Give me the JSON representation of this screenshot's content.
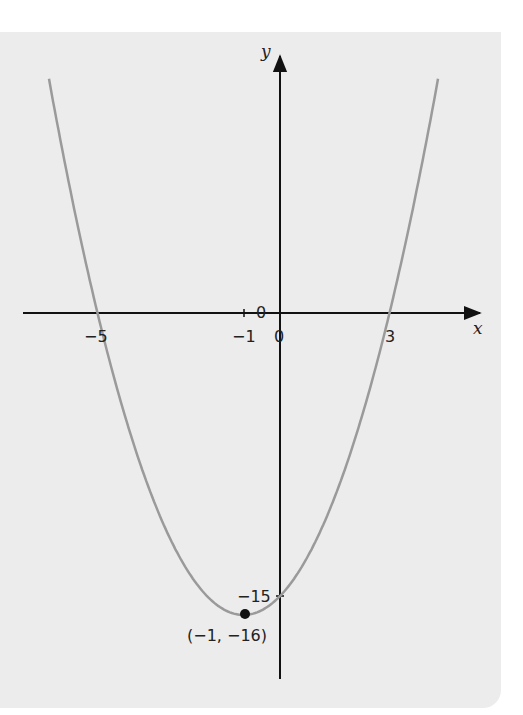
{
  "chart_data": {
    "type": "line",
    "title": "",
    "function": "y = x^2 + 2x - 15",
    "xlabel": "x",
    "ylabel": "y",
    "xlim": [
      -7.6,
      5.6
    ],
    "ylim": [
      -19.5,
      14.5
    ],
    "grid": false,
    "series": [
      {
        "name": "parabola",
        "color": "#9a9a9a",
        "x": [
          -6.33,
          -6,
          -5,
          -4,
          -3,
          -2,
          -1,
          0,
          1,
          2,
          3,
          4,
          4.33
        ],
        "y": [
          12.4,
          9,
          0,
          -7,
          -12,
          -15,
          -16,
          -15,
          -12,
          -7,
          0,
          9,
          12.4
        ]
      }
    ],
    "tick_labels_x": [
      "-5",
      "-1",
      "0",
      "3"
    ],
    "tick_labels_y": [
      "0",
      "-15"
    ],
    "annotations": [
      {
        "text": "(-1, -16)",
        "x": -1,
        "y": -16,
        "type": "vertex-point"
      },
      {
        "text": "-15",
        "x": 0,
        "y": -15,
        "type": "y-intercept"
      }
    ]
  },
  "labels": {
    "x_axis": "x",
    "y_axis": "y",
    "x_neg5": "−5",
    "x_neg1": "−1",
    "x_zero": "0",
    "x_three": "3",
    "y_zero": "0",
    "y_neg15": "−15",
    "vertex": "(−1, −16)"
  },
  "colors": {
    "panel": "#ececec",
    "curve": "#9a9a9a",
    "axis": "#111111"
  }
}
